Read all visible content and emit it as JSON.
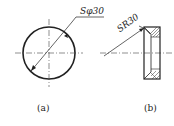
{
  "figure_a": {
    "dimension": "Sφ30",
    "caption": "(a)"
  },
  "figure_b": {
    "dimension": "SR30",
    "caption": "(b)"
  }
}
